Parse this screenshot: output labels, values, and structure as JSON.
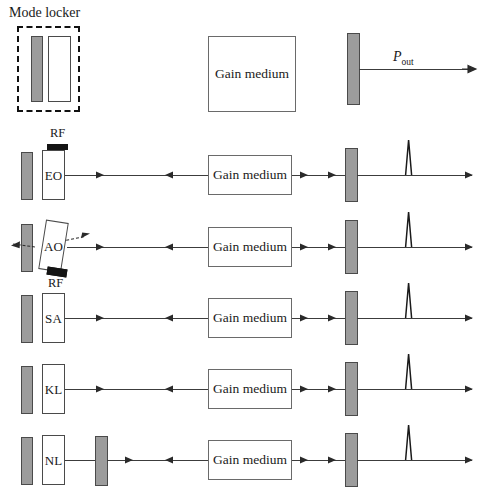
{
  "figure": {
    "caption": "Mode locker",
    "output_power_symbol": "P",
    "output_power_subscript": "out",
    "gain_medium_label": "Gain medium",
    "colors": {
      "mirror_fill": "#9c9c9c",
      "mirror_stroke": "#4a4a4a",
      "box_stroke": "#4a4a4a",
      "beam": "#3c3c3c",
      "rf_bar": "#141414",
      "background": "#ffffff"
    }
  },
  "rows": [
    {
      "id": "row-cw",
      "modulator_label": "",
      "gain_medium_label": "Gain medium",
      "has_output_pulse": false,
      "has_rf_top": false,
      "has_rf_bottom": false,
      "has_extra_mirror": false,
      "tilted": false
    },
    {
      "id": "row-eo",
      "modulator_label": "EO",
      "gain_medium_label": "Gain medium",
      "rf_label": "RF",
      "has_output_pulse": true,
      "has_rf_top": true,
      "has_rf_bottom": false,
      "has_extra_mirror": false,
      "tilted": false
    },
    {
      "id": "row-ao",
      "modulator_label": "AO",
      "gain_medium_label": "Gain medium",
      "rf_label": "RF",
      "has_output_pulse": true,
      "has_rf_top": false,
      "has_rf_bottom": true,
      "has_extra_mirror": false,
      "tilted": true
    },
    {
      "id": "row-sa",
      "modulator_label": "SA",
      "gain_medium_label": "Gain medium",
      "has_output_pulse": true,
      "has_rf_top": false,
      "has_rf_bottom": false,
      "has_extra_mirror": false,
      "tilted": false
    },
    {
      "id": "row-kl",
      "modulator_label": "KL",
      "gain_medium_label": "Gain medium",
      "has_output_pulse": true,
      "has_rf_top": false,
      "has_rf_bottom": false,
      "has_extra_mirror": false,
      "tilted": false
    },
    {
      "id": "row-nl",
      "modulator_label": "NL",
      "gain_medium_label": "Gain medium",
      "has_output_pulse": true,
      "has_rf_top": false,
      "has_rf_bottom": false,
      "has_extra_mirror": true,
      "tilted": false
    }
  ]
}
